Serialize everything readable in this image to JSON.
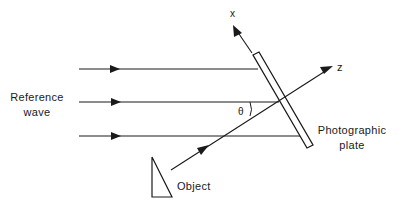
{
  "diagram": {
    "labels": {
      "reference_line1": "Reference",
      "reference_line2": "wave",
      "x_axis": "x",
      "z_axis": "z",
      "angle": "θ",
      "plate_line1": "Photographic",
      "plate_line2": "plate",
      "object": "Object"
    },
    "colors": {
      "stroke": "#1a1a1a",
      "background": "#ffffff"
    },
    "reference_rays": [
      {
        "y": 69,
        "x_start": 79,
        "x_end": 259
      },
      {
        "y": 102,
        "x_start": 79,
        "x_end": 279
      },
      {
        "y": 136,
        "x_start": 79,
        "x_end": 300
      }
    ]
  }
}
